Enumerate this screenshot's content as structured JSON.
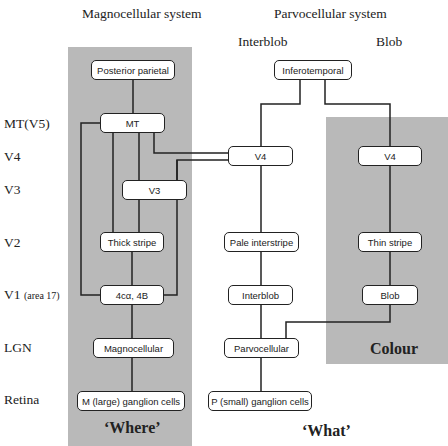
{
  "headers": {
    "magno": "Magnocellular system",
    "parvo": "Parvocellular system",
    "interblob": "Interblob",
    "blob": "Blob"
  },
  "rows": {
    "mt": "MT(V5)",
    "v4": "V4",
    "v3": "V3",
    "v2": "V2",
    "v1": "V1",
    "v1_sub": "(area 17)",
    "lgn": "LGN",
    "retina": "Retina"
  },
  "nodes": {
    "posterior_parietal": "Posterior parietal",
    "mt": "MT",
    "v3": "V3",
    "thick_stripe": "Thick stripe",
    "layer_4ca_4b": "4cα, 4B",
    "magnocellular": "Magnocellular",
    "m_ganglion": "M (large) ganglion cells",
    "inferotemporal": "Inferotemporal",
    "v4_interblob": "V4",
    "pale_interstripe": "Pale interstripe",
    "interblob": "Interblob",
    "parvocellular": "Parvocellular",
    "p_ganglion": "P (small) ganglion cells",
    "v4_blob": "V4",
    "thin_stripe": "Thin stripe",
    "blob": "Blob"
  },
  "captions": {
    "where": "‘Where’",
    "what": "‘What’",
    "colour": "Colour"
  },
  "colors": {
    "shade": "#b9b9b9",
    "line": "#222222"
  }
}
